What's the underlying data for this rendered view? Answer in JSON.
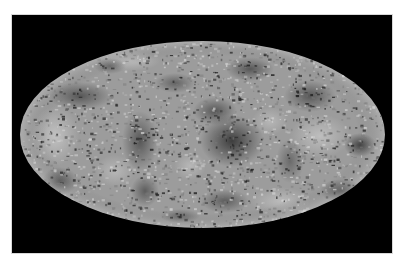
{
  "figure": {
    "kind": "all-sky map",
    "projection": "mollweide",
    "background_color": "#000000",
    "page_color": "#ffffff",
    "base_gray": "#9c9c9c",
    "rim_gray": "#b4b4b4",
    "dark_color": "#1e1e1e",
    "light_color": "#dcdcdc",
    "ellipse": {
      "cx": 182.5,
      "cy": 93.5,
      "rx": 182.5,
      "ry": 93.5
    },
    "dark_regions": [
      {
        "x": 212,
        "y": 100,
        "rx": 32,
        "ry": 26,
        "o": 0.75
      },
      {
        "x": 195,
        "y": 70,
        "rx": 22,
        "ry": 14,
        "o": 0.55
      },
      {
        "x": 120,
        "y": 100,
        "rx": 18,
        "ry": 30,
        "o": 0.55
      },
      {
        "x": 125,
        "y": 150,
        "rx": 14,
        "ry": 16,
        "o": 0.5
      },
      {
        "x": 60,
        "y": 55,
        "rx": 32,
        "ry": 14,
        "o": 0.55
      },
      {
        "x": 230,
        "y": 28,
        "rx": 24,
        "ry": 12,
        "o": 0.55
      },
      {
        "x": 290,
        "y": 55,
        "rx": 26,
        "ry": 16,
        "o": 0.55
      },
      {
        "x": 340,
        "y": 104,
        "rx": 16,
        "ry": 12,
        "o": 0.7
      },
      {
        "x": 322,
        "y": 150,
        "rx": 22,
        "ry": 12,
        "o": 0.55
      },
      {
        "x": 205,
        "y": 160,
        "rx": 24,
        "ry": 12,
        "o": 0.5
      },
      {
        "x": 40,
        "y": 140,
        "rx": 18,
        "ry": 14,
        "o": 0.5
      },
      {
        "x": 155,
        "y": 42,
        "rx": 20,
        "ry": 10,
        "o": 0.45
      },
      {
        "x": 270,
        "y": 120,
        "rx": 14,
        "ry": 22,
        "o": 0.4
      },
      {
        "x": 90,
        "y": 25,
        "rx": 16,
        "ry": 8,
        "o": 0.4
      },
      {
        "x": 300,
        "y": 175,
        "rx": 16,
        "ry": 6,
        "o": 0.5
      },
      {
        "x": 160,
        "y": 175,
        "rx": 20,
        "ry": 7,
        "o": 0.4
      }
    ],
    "light_regions": [
      {
        "x": 35,
        "y": 95,
        "rx": 24,
        "ry": 30,
        "o": 0.55
      },
      {
        "x": 300,
        "y": 95,
        "rx": 30,
        "ry": 22,
        "o": 0.5
      },
      {
        "x": 260,
        "y": 160,
        "rx": 30,
        "ry": 14,
        "o": 0.45
      },
      {
        "x": 110,
        "y": 20,
        "rx": 30,
        "ry": 10,
        "o": 0.45
      },
      {
        "x": 170,
        "y": 125,
        "rx": 16,
        "ry": 14,
        "o": 0.4
      },
      {
        "x": 95,
        "y": 130,
        "rx": 20,
        "ry": 16,
        "o": 0.4
      },
      {
        "x": 250,
        "y": 80,
        "rx": 18,
        "ry": 14,
        "o": 0.4
      }
    ],
    "noise_seed": 7,
    "speckle_count": 2600
  }
}
